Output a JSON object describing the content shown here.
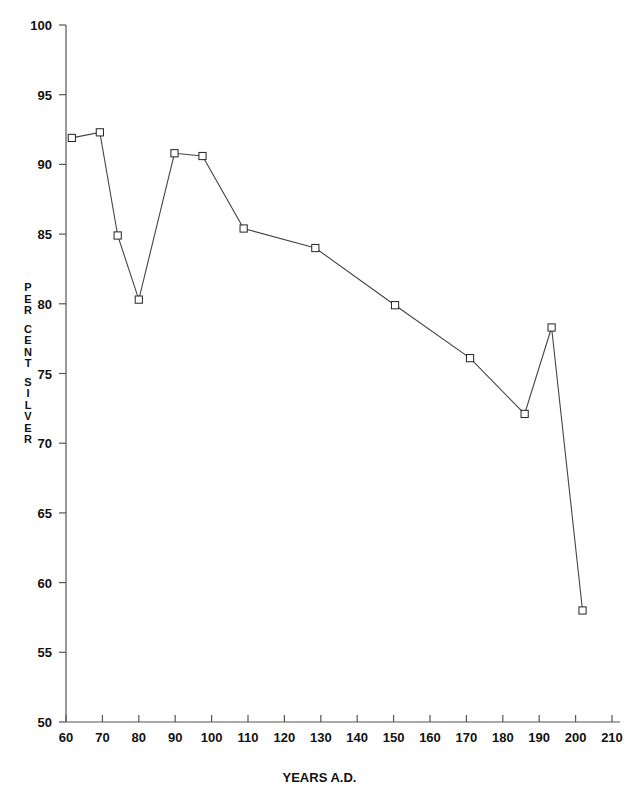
{
  "chart_data": {
    "type": "line",
    "title": "",
    "xlabel": "YEARS A.D.",
    "ylabel": "PER CENT SILVER",
    "xlim": [
      57,
      213
    ],
    "ylim": [
      50,
      100
    ],
    "xticks": [
      60,
      70,
      80,
      90,
      100,
      110,
      120,
      130,
      140,
      150,
      160,
      170,
      180,
      190,
      200,
      210
    ],
    "yticks": [
      50,
      55,
      60,
      65,
      70,
      75,
      80,
      85,
      90,
      95,
      100
    ],
    "grid": false,
    "legend": null,
    "marker": "open-square",
    "series": [
      {
        "name": "per cent silver",
        "x": [
          61.6,
          69.3,
          74.2,
          80.0,
          89.8,
          97.5,
          108.8,
          128.5,
          150.4,
          171.0,
          186.0,
          193.4,
          201.9
        ],
        "y": [
          91.9,
          92.3,
          84.9,
          80.3,
          90.8,
          90.6,
          85.4,
          84.0,
          79.9,
          76.1,
          72.1,
          78.3,
          58.0
        ]
      }
    ]
  },
  "axis": {
    "x_title": "YEARS A.D.",
    "y_title_letters": [
      "P",
      "E",
      "R",
      "",
      "C",
      "E",
      "N",
      "T",
      "",
      "S",
      "I",
      "L",
      "V",
      "E",
      "R"
    ],
    "y_tick_labels": [
      "100",
      "95",
      "90",
      "85",
      "80",
      "75",
      "70",
      "65",
      "60",
      "55",
      "50"
    ],
    "x_tick_labels": [
      "60",
      "70",
      "80",
      "90",
      "100",
      "110",
      "120",
      "130",
      "140",
      "150",
      "160",
      "170",
      "180",
      "190",
      "200",
      "210"
    ]
  },
  "style": {
    "line_color": "#444444",
    "marker_stroke": "#222222",
    "marker_fill": "#ffffff",
    "axis_color": "#555555",
    "background": "#ffffff"
  },
  "caption": ""
}
